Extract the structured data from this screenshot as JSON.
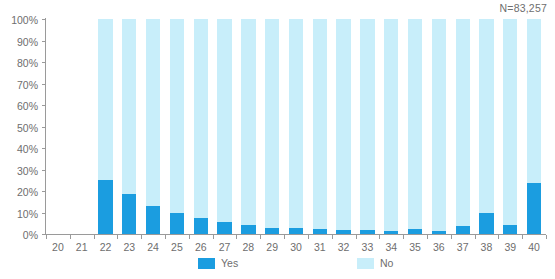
{
  "chart_data": {
    "type": "bar",
    "subtype": "stacked-100-percent",
    "title": "",
    "subtitle": "",
    "xlabel": "",
    "ylabel": "",
    "annotation": "N=83,257",
    "ylim": [
      0,
      100
    ],
    "ytick_labels": [
      "100%",
      "90%",
      "80%",
      "70%",
      "60%",
      "50%",
      "40%",
      "30%",
      "20%",
      "10%",
      "0%"
    ],
    "ytick_values": [
      100,
      90,
      80,
      70,
      60,
      50,
      40,
      30,
      20,
      10,
      0
    ],
    "grid": false,
    "legend_position": "bottom",
    "categories": [
      "20",
      "21",
      "22",
      "23",
      "24",
      "25",
      "26",
      "27",
      "28",
      "29",
      "30",
      "31",
      "32",
      "33",
      "34",
      "35",
      "36",
      "37",
      "38",
      "39",
      "40"
    ],
    "series": [
      {
        "name": "Yes",
        "color": "#1b9de0",
        "values": [
          null,
          null,
          25.0,
          18.5,
          13.0,
          10.0,
          7.5,
          5.5,
          4.0,
          3.0,
          3.0,
          2.5,
          2.0,
          2.0,
          1.5,
          2.5,
          1.5,
          3.5,
          10.0,
          4.0,
          23.5
        ]
      },
      {
        "name": "No",
        "color": "#c8eefa",
        "values": [
          null,
          null,
          75.0,
          81.5,
          87.0,
          90.0,
          92.5,
          94.5,
          96.0,
          97.0,
          97.0,
          97.5,
          98.0,
          98.0,
          98.5,
          97.5,
          98.5,
          96.5,
          90.0,
          96.0,
          76.5
        ]
      }
    ],
    "empty_categories": [
      "20",
      "21"
    ]
  },
  "legend": {
    "items": [
      {
        "label": "Yes",
        "color": "#1b9de0"
      },
      {
        "label": "No",
        "color": "#c8eefa"
      }
    ]
  },
  "colors": {
    "yes": "#1b9de0",
    "no": "#c8eefa",
    "axis": "#9a9a9a",
    "text": "#6e6e6e",
    "background": "#ffffff"
  }
}
